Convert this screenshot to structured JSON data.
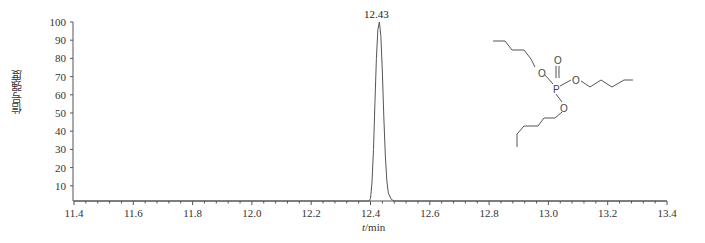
{
  "chart_data": {
    "type": "line",
    "title": "",
    "xlabel": "t/min",
    "xlabel_italic_part": "t",
    "xlabel_unit_part": "/min",
    "ylabel": "信号强度",
    "xlim": [
      11.4,
      13.4
    ],
    "ylim": [
      0,
      100
    ],
    "x_ticks": [
      11.4,
      11.6,
      11.8,
      12.0,
      12.2,
      12.4,
      12.6,
      12.8,
      13.0,
      13.2,
      13.4
    ],
    "x_tick_labels": [
      "11.4",
      "11.6",
      "11.8",
      "12.0",
      "12.2",
      "12.4",
      "12.6",
      "12.8",
      "13.0",
      "13.2",
      "13.4"
    ],
    "x_minor_tick_step": 0.04,
    "y_ticks": [
      10,
      20,
      30,
      40,
      50,
      60,
      70,
      80,
      90,
      100
    ],
    "y_tick_labels": [
      "10",
      "20",
      "30",
      "40",
      "50",
      "60",
      "70",
      "80",
      "90",
      "100"
    ],
    "grid": false,
    "legend": null,
    "series": [
      {
        "name": "chromatogram",
        "color": "#555555",
        "x": [
          11.4,
          12.38,
          12.395,
          12.4,
          12.405,
          12.41,
          12.415,
          12.42,
          12.425,
          12.43,
          12.435,
          12.44,
          12.445,
          12.45,
          12.455,
          12.46,
          12.47,
          12.48,
          12.49,
          13.4
        ],
        "values": [
          0,
          0,
          0.5,
          3,
          12,
          30,
          55,
          80,
          96,
          100,
          92,
          72,
          48,
          27,
          13,
          6,
          2.5,
          1,
          0,
          0
        ]
      }
    ],
    "annotations": [
      {
        "text": "12.43",
        "x": 12.43,
        "y": 100,
        "type": "peak-label"
      },
      {
        "text": "tributyl phosphate structure",
        "type": "chemical-structure-inset",
        "atoms": [
          "O",
          "O",
          "P",
          "O",
          "O"
        ]
      }
    ]
  },
  "ui": {
    "peak_label": "12.43",
    "ylabel": "信号强度",
    "xlabel_var": "t",
    "xlabel_unit": "/min",
    "molecule": {
      "p": "P",
      "o": "O"
    }
  }
}
